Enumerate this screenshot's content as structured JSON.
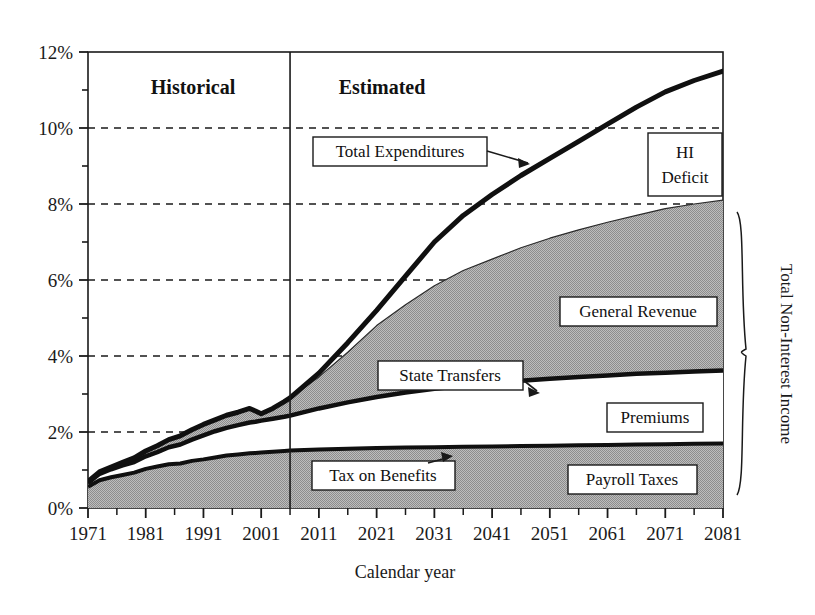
{
  "chart_data": {
    "type": "area",
    "title": "",
    "subtitle": "",
    "xlabel": "Calendar year",
    "ylabel": "",
    "xlim": [
      1971,
      2081
    ],
    "ylim": [
      0,
      12
    ],
    "grid": true,
    "grid_axis": "y",
    "legend_position": "inline-callouts",
    "y_tick_labels": [
      "0%",
      "2%",
      "4%",
      "6%",
      "8%",
      "10%",
      "12%"
    ],
    "y_tick_values": [
      0,
      2,
      4,
      6,
      8,
      10,
      12
    ],
    "y_minor_tick_values": [
      1,
      3,
      5,
      7,
      9,
      11
    ],
    "x_tick_labels": [
      "1971",
      "1981",
      "1991",
      "2001",
      "2011",
      "2021",
      "2031",
      "2041",
      "2051",
      "2061",
      "2071",
      "2081"
    ],
    "x_tick_values": [
      1971,
      1981,
      1991,
      2001,
      2011,
      2021,
      2031,
      2041,
      2051,
      2061,
      2071,
      2081
    ],
    "x_minor_tick_step": 5,
    "divider_year": 2006,
    "x": [
      1971,
      1973,
      1975,
      1977,
      1979,
      1981,
      1983,
      1985,
      1987,
      1989,
      1991,
      1993,
      1995,
      1997,
      1999,
      2000,
      2001,
      2003,
      2005,
      2006,
      2011,
      2016,
      2021,
      2026,
      2031,
      2036,
      2041,
      2046,
      2051,
      2056,
      2061,
      2066,
      2071,
      2076,
      2081
    ],
    "series": [
      {
        "name": "Payroll Taxes",
        "type": "stacked-area-band",
        "fill": "gray",
        "values": [
          0.55,
          0.72,
          0.8,
          0.86,
          0.92,
          1.02,
          1.08,
          1.14,
          1.16,
          1.22,
          1.26,
          1.3,
          1.34,
          1.36,
          1.38,
          1.39,
          1.4,
          1.41,
          1.42,
          1.43,
          1.44,
          1.45,
          1.46,
          1.46,
          1.47,
          1.47,
          1.48,
          1.48,
          1.49,
          1.49,
          1.5,
          1.5,
          1.51,
          1.51,
          1.52
        ]
      },
      {
        "name": "Tax on Benefits",
        "type": "stacked-area-band",
        "fill": "black-line",
        "values": [
          0.56,
          0.73,
          0.81,
          0.87,
          0.93,
          1.03,
          1.09,
          1.15,
          1.17,
          1.24,
          1.28,
          1.33,
          1.38,
          1.41,
          1.44,
          1.45,
          1.46,
          1.48,
          1.5,
          1.51,
          1.54,
          1.56,
          1.58,
          1.59,
          1.6,
          1.61,
          1.62,
          1.63,
          1.64,
          1.65,
          1.66,
          1.67,
          1.68,
          1.69,
          1.7
        ]
      },
      {
        "name": "Premiums",
        "type": "stacked-area-band",
        "fill": "white",
        "values": [
          0.62,
          0.84,
          0.95,
          1.04,
          1.12,
          1.26,
          1.36,
          1.48,
          1.54,
          1.66,
          1.76,
          1.86,
          1.94,
          2.0,
          2.06,
          2.08,
          2.1,
          2.14,
          2.18,
          2.2,
          2.38,
          2.54,
          2.68,
          2.8,
          2.9,
          2.98,
          3.05,
          3.11,
          3.16,
          3.21,
          3.25,
          3.29,
          3.32,
          3.35,
          3.38
        ]
      },
      {
        "name": "State Transfers",
        "type": "stacked-area-band",
        "fill": "black-line",
        "values": [
          0.66,
          0.9,
          1.02,
          1.12,
          1.21,
          1.36,
          1.47,
          1.6,
          1.67,
          1.8,
          1.91,
          2.02,
          2.11,
          2.18,
          2.25,
          2.27,
          2.3,
          2.35,
          2.4,
          2.43,
          2.62,
          2.78,
          2.92,
          3.04,
          3.14,
          3.22,
          3.29,
          3.35,
          3.4,
          3.45,
          3.49,
          3.53,
          3.56,
          3.59,
          3.62
        ]
      },
      {
        "name": "General Revenue",
        "type": "stacked-area-band",
        "fill": "gray",
        "values": [
          0.7,
          0.95,
          1.08,
          1.2,
          1.32,
          1.5,
          1.64,
          1.8,
          1.9,
          2.06,
          2.2,
          2.32,
          2.44,
          2.52,
          2.62,
          2.55,
          2.48,
          2.62,
          2.8,
          2.9,
          3.45,
          4.1,
          4.8,
          5.35,
          5.85,
          6.25,
          6.55,
          6.85,
          7.1,
          7.32,
          7.52,
          7.7,
          7.88,
          8.0,
          8.1
        ]
      },
      {
        "name": "Total Expenditures",
        "type": "line",
        "stroke": "black",
        "stroke_width": 4,
        "values": [
          0.7,
          0.95,
          1.08,
          1.2,
          1.32,
          1.5,
          1.64,
          1.8,
          1.9,
          2.06,
          2.2,
          2.32,
          2.44,
          2.52,
          2.62,
          2.55,
          2.48,
          2.62,
          2.8,
          2.9,
          3.55,
          4.35,
          5.2,
          6.1,
          7.0,
          7.7,
          8.25,
          8.75,
          9.2,
          9.65,
          10.1,
          10.55,
          10.95,
          11.25,
          11.5
        ]
      }
    ],
    "annotations": [
      {
        "id": "historical",
        "text": "Historical",
        "kind": "period-label"
      },
      {
        "id": "estimated",
        "text": "Estimated",
        "kind": "period-label"
      },
      {
        "id": "total-expenditures",
        "text": "Total Expenditures",
        "kind": "callout-box",
        "arrow": true
      },
      {
        "id": "hi-deficit",
        "text": "HI Deficit",
        "line1": "HI",
        "line2": "Deficit",
        "kind": "callout-box",
        "arrow": false
      },
      {
        "id": "general-revenue",
        "text": "General Revenue",
        "kind": "callout-box",
        "arrow": false
      },
      {
        "id": "state-transfers",
        "text": "State Transfers",
        "kind": "callout-box",
        "arrow": true
      },
      {
        "id": "premiums",
        "text": "Premiums",
        "kind": "callout-box",
        "arrow": false
      },
      {
        "id": "tax-on-benefits",
        "text": "Tax on Benefits",
        "kind": "callout-box",
        "arrow": true
      },
      {
        "id": "payroll-taxes",
        "text": "Payroll Taxes",
        "kind": "callout-box",
        "arrow": false
      },
      {
        "id": "total-non-interest-income",
        "text": "Total Non-Interest Income",
        "kind": "brace-label",
        "rotated": true
      }
    ],
    "colors": {
      "fill_gray": "#a9a9a9",
      "fill_white": "#ffffff",
      "line_black": "#101010",
      "axis": "#1a1a1a",
      "grid": "#1a1a1a",
      "background": "#ffffff"
    }
  },
  "axes": {
    "y_labels": [
      "12%",
      "10%",
      "8%",
      "6%",
      "4%",
      "2%",
      "0%"
    ],
    "x_labels": [
      "1971",
      "1981",
      "1991",
      "2001",
      "2011",
      "2021",
      "2031",
      "2041",
      "2051",
      "2061",
      "2071",
      "2081"
    ],
    "x_title": "Calendar year"
  },
  "labels": {
    "historical": "Historical",
    "estimated": "Estimated",
    "total_expenditures": "Total Expenditures",
    "hi_deficit_line1": "HI",
    "hi_deficit_line2": "Deficit",
    "general_revenue": "General Revenue",
    "state_transfers": "State Transfers",
    "premiums": "Premiums",
    "tax_on_benefits": "Tax on Benefits",
    "payroll_taxes": "Payroll Taxes",
    "total_non_interest_income": "Total Non-Interest Income"
  }
}
